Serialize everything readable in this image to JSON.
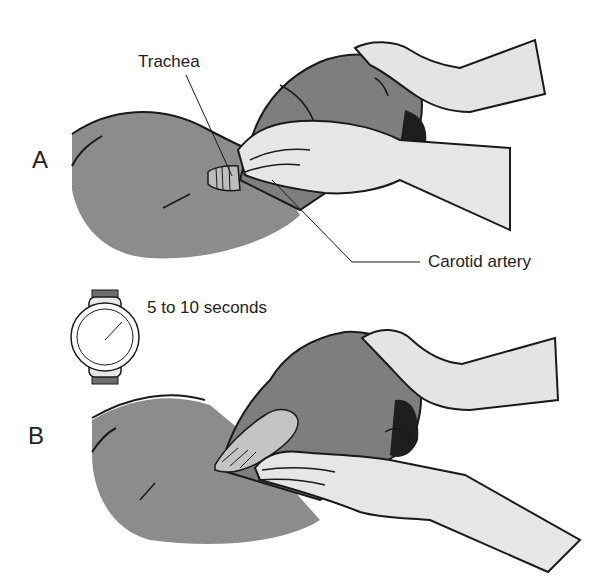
{
  "figure": {
    "panels": [
      {
        "letter": "A",
        "description": "Locating the trachea with fingers while tilting the head back"
      },
      {
        "letter": "B",
        "description": "Sliding fingers into the groove to palpate the carotid artery"
      }
    ],
    "labels": {
      "trachea": "Trachea",
      "carotid": "Carotid artery",
      "duration": "5 to 10 seconds"
    },
    "icons": [
      "wristwatch-icon"
    ],
    "colors": {
      "skin": "#8c8c8c",
      "skin_dark": "#6e6e6e",
      "glove": "#e4e4e4",
      "hair": "#1e1e1e",
      "line": "#1a1a1a",
      "background": "#ffffff"
    }
  }
}
